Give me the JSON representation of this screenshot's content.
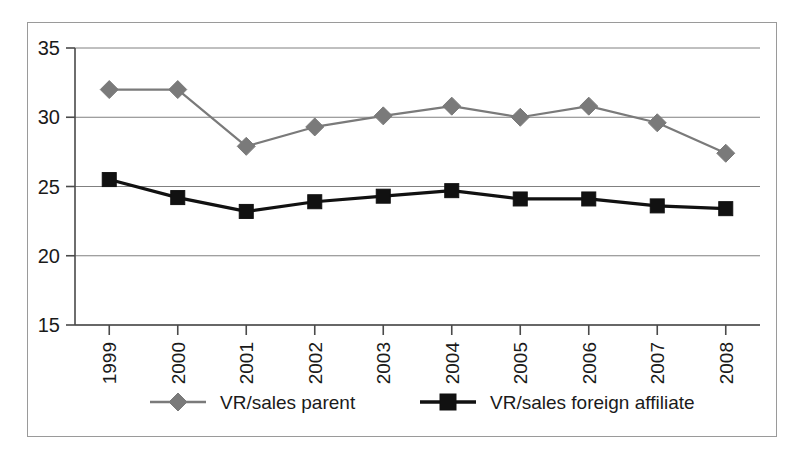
{
  "chart_data": {
    "type": "line",
    "title": "",
    "subtitle": "",
    "xlabel": "",
    "ylabel": "",
    "categories": [
      "1999",
      "2000",
      "2001",
      "2002",
      "2003",
      "2004",
      "2005",
      "2006",
      "2007",
      "2008"
    ],
    "series": [
      {
        "name": "VR/sales parent",
        "values": [
          32.0,
          32.0,
          27.9,
          29.3,
          30.1,
          30.8,
          30.0,
          30.8,
          29.6,
          27.4
        ],
        "color": "#7a7a7a",
        "marker": "diamond"
      },
      {
        "name": "VR/sales foreign affiliate",
        "values": [
          25.5,
          24.2,
          23.2,
          23.9,
          24.3,
          24.7,
          24.1,
          24.1,
          23.6,
          23.4
        ],
        "color": "#111111",
        "marker": "square"
      }
    ],
    "ylim": [
      15,
      35
    ],
    "yticks": [
      15,
      20,
      25,
      30,
      35
    ],
    "ytick_labels": [
      "15",
      "20",
      "25",
      "30",
      "35"
    ],
    "grid": true,
    "grid_axis": "y",
    "legend_position": "bottom",
    "x_tick_rotation": -90
  },
  "legend": {
    "entries": [
      {
        "label": "VR/sales parent"
      },
      {
        "label": "VR/sales foreign affiliate"
      }
    ]
  },
  "colors": {
    "parent_series": "#7a7a7a",
    "affiliate_series": "#111111",
    "gridline": "#808080",
    "axis": "#4a4a4a",
    "frame": "#9a9a9a",
    "background": "#ffffff"
  }
}
